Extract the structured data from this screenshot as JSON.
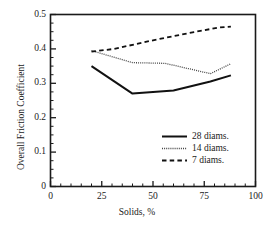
{
  "chart_data": {
    "type": "line",
    "title": "",
    "xlabel": "Solids, %",
    "ylabel": "Overall Friction Coefficient",
    "xlim": [
      0,
      100
    ],
    "ylim": [
      0,
      0.5
    ],
    "xticks": [
      "0",
      "25",
      "50",
      "75",
      "100"
    ],
    "xtick_values": [
      0,
      25,
      50,
      75,
      100
    ],
    "yticks": [
      "0",
      "0.1",
      "0.2",
      "0.3",
      "0.4",
      "0.5"
    ],
    "ytick_values": [
      0,
      0.1,
      0.2,
      0.3,
      0.4,
      0.5
    ],
    "x_minor_step": 5,
    "y_minor_step": 0.025,
    "grid": false,
    "legend_position": "lower-right",
    "series": [
      {
        "name": "28 diams.",
        "style": "solid",
        "color": "#111111",
        "width": 2.0,
        "x": [
          20,
          40,
          60,
          78,
          88
        ],
        "y": [
          0.35,
          0.27,
          0.279,
          0.305,
          0.323
        ]
      },
      {
        "name": "14 diams.",
        "style": "dotted",
        "color": "#444444",
        "width": 1.3,
        "x": [
          20,
          40,
          56,
          78,
          88
        ],
        "y": [
          0.395,
          0.36,
          0.358,
          0.328,
          0.357
        ]
      },
      {
        "name": "7 diams.",
        "style": "dashed",
        "color": "#111111",
        "width": 1.8,
        "x": [
          20,
          31,
          50,
          70,
          82,
          88
        ],
        "y": [
          0.392,
          0.4,
          0.425,
          0.449,
          0.462,
          0.465
        ]
      }
    ]
  },
  "legend": {
    "entries": [
      {
        "label": "28 diams."
      },
      {
        "label": "14 diams."
      },
      {
        "label": "7 diams."
      }
    ]
  },
  "axes": {
    "x_tick_0": "0",
    "x_tick_1": "25",
    "x_tick_2": "50",
    "x_tick_3": "75",
    "x_tick_4": "100",
    "y_tick_0": "0",
    "y_tick_1": "0.1",
    "y_tick_2": "0.2",
    "y_tick_3": "0.3",
    "y_tick_4": "0.4",
    "y_tick_5": "0.5"
  },
  "colors": {
    "axis": "#1a1a1a",
    "background": "#ffffff",
    "series_28": "#111111",
    "series_14": "#444444",
    "series_7": "#111111"
  }
}
